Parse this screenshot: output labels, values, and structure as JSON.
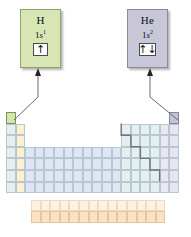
{
  "diagram": {
    "type": "periodic-table-callout"
  },
  "callouts": [
    {
      "id": "hydrogen",
      "symbol": "H",
      "config_shell": "1",
      "config_orbital": "s",
      "config_exponent": "1",
      "orbital_label": "1s",
      "electrons": "1",
      "spin_arrows": "↑",
      "fill_color": "#d7e6b4",
      "border_color": "#8fa36a",
      "points_to": "group-1-period-1"
    },
    {
      "id": "helium",
      "symbol": "He",
      "config_shell": "1",
      "config_orbital": "s",
      "config_exponent": "2",
      "orbital_label": "1s",
      "electrons": "2",
      "spin_arrows": "↑↓",
      "fill_color": "#c7c7d8",
      "border_color": "#8a8a9d",
      "points_to": "group-18-period-1"
    }
  ],
  "periodic_table": {
    "columns": 18,
    "periods": 7,
    "f_block_rows": 2,
    "f_block_columns": 14,
    "blocks": [
      {
        "name": "s-block-group-1",
        "color": "#e3f0ee"
      },
      {
        "name": "s-block-group-2",
        "color": "#fcf0cd"
      },
      {
        "name": "d-block",
        "color": "#dde6f2"
      },
      {
        "name": "p-block",
        "color": "#e3f0ee"
      },
      {
        "name": "halogens",
        "color": "#ece6f0"
      },
      {
        "name": "noble-gases",
        "color": "#e6e6f0"
      },
      {
        "name": "lanthanides",
        "color": "#fbf2e2"
      },
      {
        "name": "actinides",
        "color": "#fae3c4"
      }
    ],
    "highlighted_cells": [
      {
        "element": "H",
        "group": 1,
        "period": 1,
        "color": "#d3e5ae"
      },
      {
        "element": "He",
        "group": 18,
        "period": 1,
        "color": "#c3c3d6"
      }
    ],
    "metalloid_staircase": true,
    "staircase_color": "#6f7580"
  },
  "connectors": [
    {
      "from": "h-cell",
      "to": "h-callout",
      "arrowhead": "up"
    },
    {
      "from": "he-cell",
      "to": "he-callout",
      "arrowhead": "up"
    }
  ],
  "colors": {
    "line": "#6b6b6b",
    "grid": "#b9c6d4",
    "text": "#111111"
  }
}
